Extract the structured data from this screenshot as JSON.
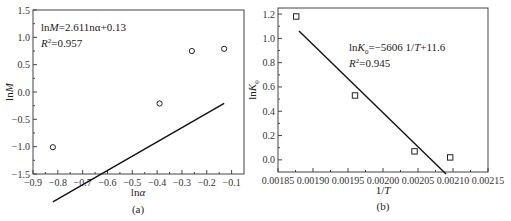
{
  "chart_data": [
    {
      "type": "scatter",
      "panel_label": "(a)",
      "xlabel": "lnα",
      "ylabel": "lnM",
      "xlim": [
        -0.9,
        -0.05
      ],
      "ylim": [
        -1.5,
        1.5
      ],
      "xticks": [
        -0.9,
        -0.8,
        -0.7,
        -0.6,
        -0.5,
        -0.4,
        -0.3,
        -0.2,
        -0.1
      ],
      "xtick_labels": [
        "−0.9",
        "−0.8",
        "−0.7",
        "−0.6",
        "−0.5",
        "−0.4",
        "−0.3",
        "−0.2",
        "−0.1"
      ],
      "yticks": [
        -1.5,
        -1.0,
        -0.5,
        0.0,
        0.5,
        1.0,
        1.5
      ],
      "ytick_labels": [
        "−1.5",
        "−1.0",
        "−0.5",
        "0.0",
        "0.5",
        "1.0",
        "1.5"
      ],
      "points": [
        {
          "x": -0.82,
          "y": -1.01
        },
        {
          "x": -0.39,
          "y": -0.21
        },
        {
          "x": -0.26,
          "y": 0.75
        },
        {
          "x": -0.13,
          "y": 0.79
        }
      ],
      "marker": "circle",
      "fit": {
        "slope": 2.611,
        "intercept": 0.13,
        "x_range": [
          -0.82,
          -0.13
        ]
      },
      "annotation": {
        "equation_prefix": "ln",
        "equation_var": "M",
        "equation_rest": "=2.611nα+0.13",
        "r2_var": "R",
        "r2_rest": "=0.957"
      },
      "grid": false
    },
    {
      "type": "scatter",
      "panel_label": "(b)",
      "xlabel": "1/T",
      "ylabel": "lnK0",
      "xlim": [
        0.00185,
        0.00215
      ],
      "ylim": [
        -0.1,
        1.25
      ],
      "xticks": [
        0.00185,
        0.0019,
        0.00195,
        0.002,
        0.00205,
        0.0021,
        0.00215
      ],
      "xtick_labels": [
        "0.00185",
        "0.00190",
        "0.00195",
        "0.00200",
        "0.00205",
        "0.00210",
        "0.00215"
      ],
      "yticks": [
        0.0,
        0.2,
        0.4,
        0.6,
        0.8,
        1.0,
        1.2
      ],
      "ytick_labels": [
        "0.0",
        "0.2",
        "0.4",
        "0.6",
        "0.8",
        "1.0",
        "1.2"
      ],
      "points": [
        {
          "x": 0.001876,
          "y": 1.18
        },
        {
          "x": 0.00196,
          "y": 0.53
        },
        {
          "x": 0.002045,
          "y": 0.07
        },
        {
          "x": 0.002096,
          "y": 0.02
        }
      ],
      "marker": "square",
      "fit": {
        "slope": -5606,
        "intercept": 11.6,
        "x_range": [
          0.00188,
          0.00209
        ]
      },
      "annotation": {
        "equation_prefix": "ln",
        "equation_var": "K",
        "equation_sub": "0",
        "equation_rest": "=−5606 1/",
        "equation_var2": "T",
        "equation_tail": "+11.6",
        "r2_var": "R",
        "r2_rest": "=0.945"
      },
      "grid": false
    }
  ],
  "labels": {
    "a": {
      "xlabel_pre": "ln",
      "xlabel_var": "α",
      "ylabel_pre": "ln",
      "ylabel_var": "M",
      "panel": "(a)"
    },
    "b": {
      "xlabel_pre": "1/",
      "xlabel_var": "T",
      "ylabel_pre": "ln",
      "ylabel_var": "K",
      "ylabel_sub": "0",
      "panel": "(b)"
    }
  }
}
